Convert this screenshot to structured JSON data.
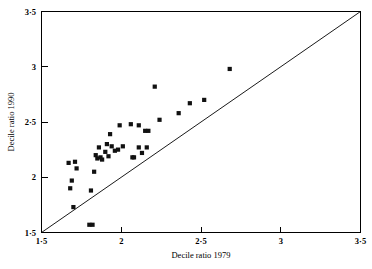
{
  "chart_data": {
    "type": "scatter",
    "title": "",
    "xlabel": "Decile ratio 1979",
    "ylabel": "Decile ratio 1990",
    "xlim": [
      1.5,
      3.5
    ],
    "ylim": [
      1.5,
      3.5
    ],
    "grid": false,
    "legend": null,
    "x_ticks": [
      1.5,
      2,
      2.5,
      3,
      3.5
    ],
    "y_ticks": [
      1.5,
      2,
      2.5,
      3,
      3.5
    ],
    "x_tick_labels": [
      "1·5",
      "2",
      "2·5",
      "3",
      "3·5"
    ],
    "y_tick_labels": [
      "1·5",
      "2",
      "2·5",
      "3",
      "3·5"
    ],
    "marker": "filled-square",
    "marker_color": "#111111",
    "reference_line": {
      "name": "identity-line",
      "from": [
        1.5,
        1.5
      ],
      "to": [
        3.5,
        3.5
      ],
      "description": "45 degree line of equality"
    },
    "points": [
      [
        1.8,
        1.57
      ],
      [
        1.82,
        1.57
      ],
      [
        1.7,
        1.73
      ],
      [
        1.81,
        1.88
      ],
      [
        1.68,
        1.9
      ],
      [
        1.69,
        1.97
      ],
      [
        1.83,
        2.05
      ],
      [
        1.72,
        2.08
      ],
      [
        1.67,
        2.13
      ],
      [
        1.71,
        2.14
      ],
      [
        1.85,
        2.17
      ],
      [
        1.87,
        2.18
      ],
      [
        1.88,
        2.16
      ],
      [
        1.92,
        2.19
      ],
      [
        1.84,
        2.2
      ],
      [
        2.07,
        2.18
      ],
      [
        2.08,
        2.18
      ],
      [
        2.13,
        2.22
      ],
      [
        1.9,
        2.23
      ],
      [
        1.96,
        2.24
      ],
      [
        1.98,
        2.25
      ],
      [
        1.86,
        2.27
      ],
      [
        1.94,
        2.28
      ],
      [
        2.01,
        2.28
      ],
      [
        2.11,
        2.27
      ],
      [
        2.16,
        2.27
      ],
      [
        1.91,
        2.3
      ],
      [
        1.93,
        2.39
      ],
      [
        2.15,
        2.42
      ],
      [
        2.17,
        2.42
      ],
      [
        1.99,
        2.47
      ],
      [
        2.06,
        2.48
      ],
      [
        2.11,
        2.47
      ],
      [
        2.24,
        2.52
      ],
      [
        2.36,
        2.58
      ],
      [
        2.43,
        2.67
      ],
      [
        2.52,
        2.7
      ],
      [
        2.21,
        2.82
      ],
      [
        2.68,
        2.98
      ]
    ]
  },
  "axes": {
    "x_title": "Decile ratio 1979",
    "y_title": "Decile ratio 1990"
  }
}
